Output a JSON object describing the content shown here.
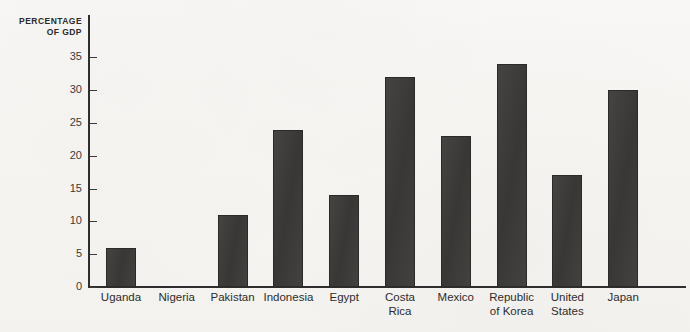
{
  "figure": {
    "paper_color": "#f5f4f1",
    "bar_color": "#3b3a39",
    "axis_color": "#2e2e2e",
    "y_axis_title": "PERCENTAGE\nOF GDP",
    "bleed_top": "",
    "bleed_bottom": ""
  },
  "chart_data": {
    "type": "bar",
    "title": "",
    "subtitle": "",
    "xlabel": "",
    "ylabel": "PERCENTAGE OF GDP",
    "ylim": [
      0,
      37
    ],
    "yticks": [
      0,
      5,
      10,
      15,
      20,
      25,
      30,
      35
    ],
    "ytick_labels": [
      "0",
      "5",
      "10",
      "15",
      "20",
      "25",
      "30",
      "35"
    ],
    "grid": false,
    "legend": null,
    "orientation": "vertical",
    "categories": [
      "Uganda",
      "Nigeria",
      "Pakistan",
      "Indonesia",
      "Egypt",
      "Costa Rica",
      "Mexico",
      "Republic of Korea",
      "United States",
      "Japan"
    ],
    "category_label_lines": [
      [
        "Uganda"
      ],
      [
        "Nigeria"
      ],
      [
        "Pakistan"
      ],
      [
        "Indonesia"
      ],
      [
        "Egypt"
      ],
      [
        "Costa",
        "Rica"
      ],
      [
        "Mexico"
      ],
      [
        "Republic",
        "of Korea"
      ],
      [
        "United",
        "States"
      ],
      [
        "Japan"
      ]
    ],
    "values": [
      6,
      0,
      11,
      24,
      14,
      32,
      23,
      34,
      17,
      30
    ],
    "annotations": []
  }
}
